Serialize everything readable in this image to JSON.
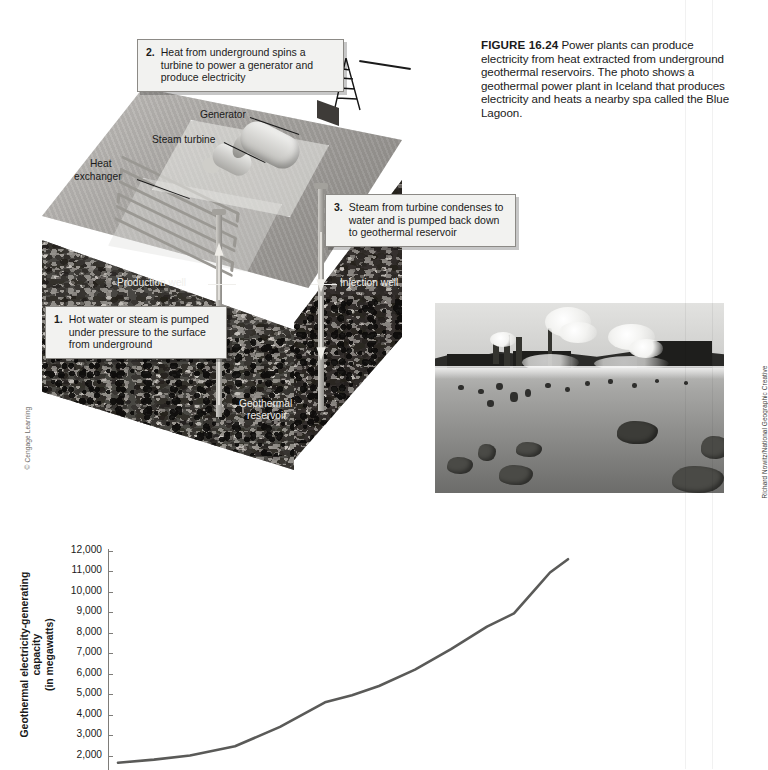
{
  "caption": {
    "label": "FIGURE 16.24",
    "text": " Power plants can produce electricity from heat extracted from underground geothermal reservoirs. The photo shows a geothermal power plant in Iceland that produces electricity and heats a nearby spa called the Blue Lagoon."
  },
  "diagram": {
    "callouts": [
      {
        "num": "1.",
        "text": "Hot water or steam is pumped under pressure to the surface from underground"
      },
      {
        "num": "2.",
        "text": "Heat from underground spins a turbine to power a generator and produce electricity"
      },
      {
        "num": "3.",
        "text": "Steam from turbine condenses to water and is pumped back down to geothermal reservoir"
      }
    ],
    "labels": {
      "generator": "Generator",
      "steam_turbine": "Steam turbine",
      "heat_exchanger_line1": "Heat",
      "heat_exchanger_line2": "exchanger",
      "production_well": "Production well",
      "injection_well": "Injection well",
      "reservoir_line1": "Geothermal",
      "reservoir_line2": "reservoir"
    },
    "copyright": "© Cengage Learning"
  },
  "photo": {
    "credit": "Richard Nowitz/National Geographic Creative",
    "alt": "Blue Lagoon geothermal spa with power plant and steam plumes in Iceland"
  },
  "chart_data": {
    "type": "line",
    "title": "",
    "xlabel": "",
    "ylabel": "Geothermal electricity-generating capacity (in megawatts)",
    "ylabel_line1": "Geothermal electricity-generating capacity",
    "ylabel_line2": "(in megawatts)",
    "ytick_labels": [
      "12,000",
      "11,000",
      "10,000",
      "9,000",
      "8,000",
      "7,000",
      "6,000",
      "5,000",
      "4,000",
      "3,000",
      "2,000"
    ],
    "ytick_values": [
      12000,
      11000,
      10000,
      9000,
      8000,
      7000,
      6000,
      5000,
      4000,
      3000,
      2000
    ],
    "ylim": [
      1500,
      12000
    ],
    "grid": false,
    "legend": "none",
    "note": "x-axis is cropped off the bottom edge of the screenshot",
    "series": [
      {
        "name": "Geothermal electricity-generating capacity",
        "color": "#5a5a58",
        "points": [
          {
            "x": 0.0,
            "y": 1650
          },
          {
            "x": 0.08,
            "y": 1800
          },
          {
            "x": 0.16,
            "y": 2000
          },
          {
            "x": 0.26,
            "y": 2450
          },
          {
            "x": 0.36,
            "y": 3400
          },
          {
            "x": 0.46,
            "y": 4600
          },
          {
            "x": 0.52,
            "y": 4950
          },
          {
            "x": 0.58,
            "y": 5400
          },
          {
            "x": 0.66,
            "y": 6200
          },
          {
            "x": 0.74,
            "y": 7200
          },
          {
            "x": 0.82,
            "y": 8300
          },
          {
            "x": 0.88,
            "y": 8950
          },
          {
            "x": 0.93,
            "y": 10200
          },
          {
            "x": 0.96,
            "y": 10950
          },
          {
            "x": 1.0,
            "y": 11600
          }
        ]
      }
    ]
  }
}
